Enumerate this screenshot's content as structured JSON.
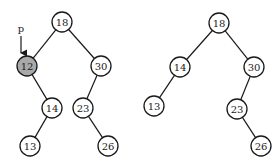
{
  "diagram": {
    "type": "binary-search-tree-deletion",
    "trees": [
      {
        "name": "before",
        "pointer": {
          "label": "p",
          "target": "12"
        },
        "nodes": [
          {
            "id": "18",
            "label": "18",
            "highlight": false
          },
          {
            "id": "12",
            "label": "12",
            "highlight": true
          },
          {
            "id": "30",
            "label": "30",
            "highlight": false
          },
          {
            "id": "14",
            "label": "14",
            "highlight": false
          },
          {
            "id": "23",
            "label": "23",
            "highlight": false
          },
          {
            "id": "13",
            "label": "13",
            "highlight": false
          },
          {
            "id": "26",
            "label": "26",
            "highlight": false
          }
        ],
        "edges": [
          [
            "18",
            "12"
          ],
          [
            "18",
            "30"
          ],
          [
            "12",
            "14"
          ],
          [
            "30",
            "23"
          ],
          [
            "14",
            "13"
          ],
          [
            "23",
            "26"
          ]
        ]
      },
      {
        "name": "after",
        "nodes": [
          {
            "id": "18",
            "label": "18",
            "highlight": false
          },
          {
            "id": "14",
            "label": "14",
            "highlight": false
          },
          {
            "id": "30",
            "label": "30",
            "highlight": false
          },
          {
            "id": "13",
            "label": "13",
            "highlight": false
          },
          {
            "id": "23",
            "label": "23",
            "highlight": false
          },
          {
            "id": "26",
            "label": "26",
            "highlight": false
          }
        ],
        "edges": [
          [
            "18",
            "14"
          ],
          [
            "18",
            "30"
          ],
          [
            "14",
            "13"
          ],
          [
            "30",
            "23"
          ],
          [
            "23",
            "26"
          ]
        ]
      }
    ],
    "colors": {
      "highlight_fill": "#a9a9a9",
      "stroke": "#1a1a1a"
    }
  }
}
